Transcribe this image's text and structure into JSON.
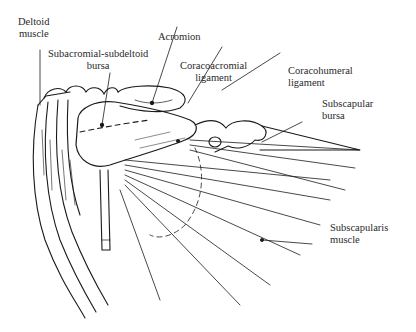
{
  "figure": {
    "type": "anatomical-illustration",
    "labels": [
      {
        "id": "deltoid",
        "line1": "Deltoid",
        "line2": "muscle"
      },
      {
        "id": "subacromial",
        "line1": "Subacromial-subdeltoid",
        "line2": "bursa"
      },
      {
        "id": "acromion",
        "line1": "Acromion"
      },
      {
        "id": "coracoacromial",
        "line1": "Coracoacromial",
        "line2": "ligament"
      },
      {
        "id": "coracohumeral",
        "line1": "Coracohumeral",
        "line2": "ligament"
      },
      {
        "id": "subscapular-bursa",
        "line1": "Subscapular",
        "line2": "bursa"
      },
      {
        "id": "subscapularis",
        "line1": "Subscapularis",
        "line2": "muscle"
      }
    ]
  }
}
